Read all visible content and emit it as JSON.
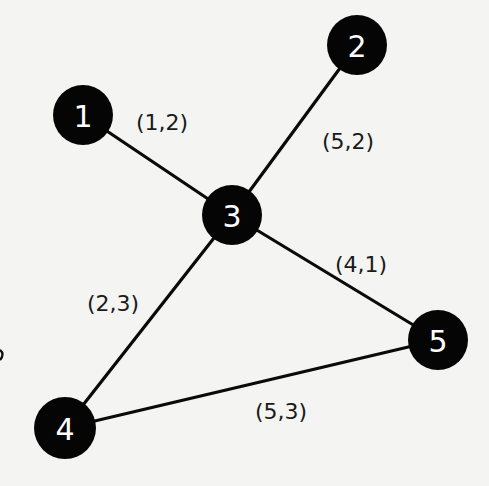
{
  "diagram": {
    "type": "weighted-graph",
    "background": "#f4f4f2",
    "node_color": "#050505",
    "node_label_color": "#ffffff",
    "edge_color": "#0a0a0a",
    "nodes": [
      {
        "id": "1",
        "label": "1",
        "x": 83,
        "y": 115,
        "r": 30
      },
      {
        "id": "2",
        "label": "2",
        "x": 357,
        "y": 45,
        "r": 30
      },
      {
        "id": "3",
        "label": "3",
        "x": 232,
        "y": 215,
        "r": 30
      },
      {
        "id": "4",
        "label": "4",
        "x": 65,
        "y": 428,
        "r": 31
      },
      {
        "id": "5",
        "label": "5",
        "x": 438,
        "y": 340,
        "r": 30
      }
    ],
    "edges": [
      {
        "from": "1",
        "to": "3",
        "label": "(1,2)",
        "label_x": 162,
        "label_y": 122
      },
      {
        "from": "2",
        "to": "3",
        "label": "(5,2)",
        "label_x": 348,
        "label_y": 141
      },
      {
        "from": "3",
        "to": "5",
        "label": "(4,1)",
        "label_x": 361,
        "label_y": 264
      },
      {
        "from": "3",
        "to": "4",
        "label": "(2,3)",
        "label_x": 113,
        "label_y": 303
      },
      {
        "from": "4",
        "to": "5",
        "label": "(5,3)",
        "label_x": 281,
        "label_y": 411
      }
    ]
  }
}
